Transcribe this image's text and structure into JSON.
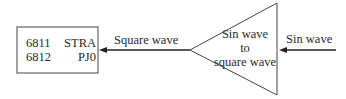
{
  "diagram": {
    "box": {
      "rows": [
        {
          "left": "6811",
          "right": "STRA"
        },
        {
          "left": "6812",
          "right": "PJ0"
        }
      ]
    },
    "converter": {
      "lines": [
        "Sin wave",
        "to",
        "square wave"
      ]
    },
    "output_label": "Square wave",
    "input_label": "Sin wave"
  }
}
